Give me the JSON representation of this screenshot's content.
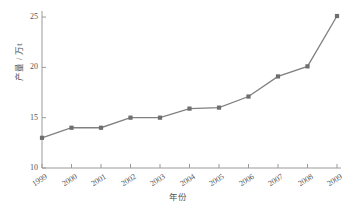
{
  "chart_data": {
    "type": "line",
    "title": "",
    "xlabel": "年份",
    "ylabel": "产量 / 万t",
    "categories": [
      "1999",
      "2000",
      "2001",
      "2002",
      "2003",
      "2004",
      "2005",
      "2006",
      "2007",
      "2008",
      "2009"
    ],
    "values": [
      13.0,
      14.0,
      14.0,
      15.0,
      15.0,
      15.9,
      16.0,
      17.1,
      19.1,
      20.1,
      25.1
    ],
    "series": [
      {
        "name": "产量",
        "values": [
          13.0,
          14.0,
          14.0,
          15.0,
          15.0,
          15.9,
          16.0,
          17.1,
          19.1,
          20.1,
          25.1
        ]
      }
    ],
    "ylim": [
      10,
      25.6
    ],
    "yticks": [
      10,
      15,
      20,
      25
    ],
    "ytick_labels": [
      "10",
      "15",
      "20",
      "25"
    ],
    "xtick_labels": [
      "1999",
      "2000",
      "2001",
      "2002",
      "2003",
      "2004",
      "2005",
      "2006",
      "2007",
      "2008",
      "2009"
    ],
    "grid": false,
    "legend": false,
    "legend_position": "none",
    "marker": "square",
    "line_color": "#808080",
    "marker_color": "#6e6e6e",
    "axis_color": "#9a9a9a",
    "text_color": "#555555",
    "background": "#ffffff"
  }
}
